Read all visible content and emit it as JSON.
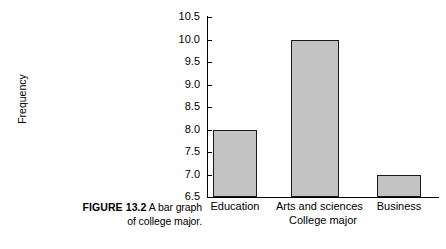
{
  "figure": {
    "caption_label": "FIGURE 13.2",
    "caption_line1": "A bar graph",
    "caption_line2": "of college major."
  },
  "chart_data": {
    "type": "bar",
    "title": "",
    "categories": [
      "Education",
      "Arts and sciences",
      "Business"
    ],
    "values": [
      8.0,
      10.0,
      7.0
    ],
    "xlabel": "College major",
    "ylabel": "Frequency",
    "ylim": [
      6.5,
      10.5
    ],
    "ytick_labels": [
      "6.5",
      "7.0",
      "7.5",
      "8.0",
      "8.5",
      "9.0",
      "9.5",
      "10.0",
      "10.5"
    ],
    "ytick_values": [
      6.5,
      7.0,
      7.5,
      8.0,
      8.5,
      9.0,
      9.5,
      10.0,
      10.5
    ],
    "grid": false,
    "legend": "none",
    "bar_fill_color": "#c3c3c3",
    "bar_edge_color": "#1a1a1a",
    "axis_color": "#000000"
  }
}
